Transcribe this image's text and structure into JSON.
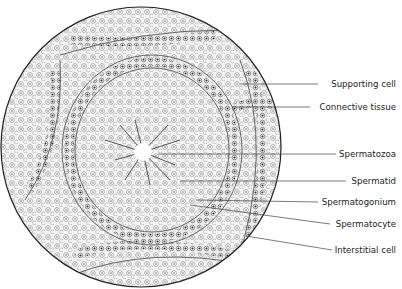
{
  "figure": {
    "labels": [
      {
        "id": "supporting-cell",
        "text": "Supporting cell",
        "y": 84,
        "line_start": [
          240,
          84
        ]
      },
      {
        "id": "connective-tissue",
        "text": "Connective tissue",
        "y": 107,
        "line_start": [
          232,
          107
        ]
      },
      {
        "id": "spermatozoa",
        "text": "Spermatozoa",
        "y": 154,
        "line_start": [
          158,
          154
        ]
      },
      {
        "id": "spermatid",
        "text": "Spermatid",
        "y": 181,
        "line_start": [
          180,
          181
        ]
      },
      {
        "id": "spermatogonium",
        "text": "Spermatogonium",
        "y": 202,
        "line_start": [
          196,
          200
        ]
      },
      {
        "id": "spermatocyte",
        "text": "Spermatocyte",
        "y": 224,
        "line_start": [
          190,
          205
        ]
      },
      {
        "id": "interstitial-cell",
        "text": "Interstitial cell",
        "y": 250,
        "line_start": [
          246,
          236
        ]
      }
    ]
  }
}
